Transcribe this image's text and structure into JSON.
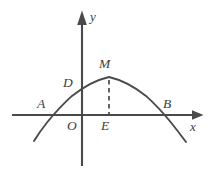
{
  "figure": {
    "background_color": "#ffffff",
    "ink_color": "#4a4a4a",
    "width": 216,
    "height": 190
  },
  "axes": {
    "x_label": "x",
    "y_label": "y",
    "origin_label": "O",
    "x_axis": {
      "x_start": 12,
      "x_end": 202,
      "y": 115
    },
    "y_axis": {
      "x": 82,
      "y_top": 12,
      "y_bottom": 166
    }
  },
  "points": [
    {
      "id": "A",
      "label": "A",
      "role": "left-x-intercept",
      "label_x": 37,
      "label_y": 97,
      "px": 52,
      "py": 115
    },
    {
      "id": "D",
      "label": "D",
      "role": "y-intercept",
      "label_x": 63,
      "label_y": 76,
      "px": 82,
      "py": 90
    },
    {
      "id": "M",
      "label": "M",
      "role": "vertex",
      "label_x": 99,
      "label_y": 58,
      "px": 109,
      "py": 77
    },
    {
      "id": "B",
      "label": "B",
      "role": "right-x-intercept",
      "label_x": 163,
      "label_y": 97,
      "px": 167,
      "py": 115
    },
    {
      "id": "E",
      "label": "E",
      "role": "foot-of-perpendicular",
      "label_x": 101,
      "label_y": 118,
      "px": 109,
      "py": 115
    },
    {
      "id": "O",
      "label": "O",
      "role": "origin",
      "label_x": 67,
      "label_y": 118,
      "px": 82,
      "py": 115
    }
  ],
  "curve": {
    "type": "parabola",
    "opens": "down",
    "vertex": [
      109,
      77
    ],
    "x_intercepts": [
      52,
      167
    ],
    "y_intercept_px": [
      82,
      90
    ],
    "draw_range_px": [
      34,
      186
    ],
    "path": "M 34,141 Q 40.5,130.6 47,122.5 Q 59.5,107.2 72,95.9 Q 90.5,81.3 109,77 Q 127.5,81.3 146,95.9 Q 158.5,107.2 171,122.5 Q 178.2,131.5 186,142"
  },
  "dashed_segment": {
    "from": [
      109,
      80
    ],
    "to": [
      109,
      114
    ],
    "description": "vertical dashed line from vertex M down to point E on x-axis"
  },
  "arrows": {
    "x_arrowhead": "M 192,110.5 L 203,115 L 192,119.5 Z",
    "y_arrowhead": "M 77.3,24 L 82,11 L 86.7,24 Z"
  }
}
